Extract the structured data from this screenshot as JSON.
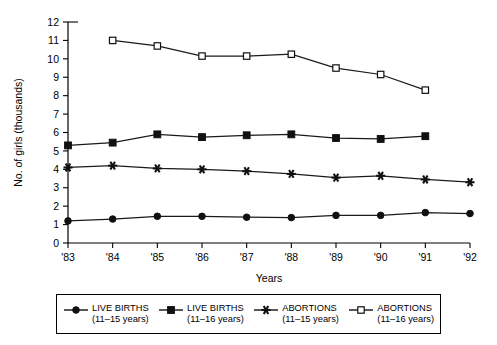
{
  "chart_data": {
    "type": "line",
    "title": "",
    "xlabel": "Years",
    "ylabel": "No. of girls (thousands)",
    "categories": [
      "'83",
      "'84",
      "'85",
      "'86",
      "'87",
      "'88",
      "'89",
      "'90",
      "'91",
      "'92"
    ],
    "ylim": [
      0,
      12
    ],
    "ytick_labels": [
      "0",
      "1",
      "2",
      "3",
      "4",
      "5",
      "6",
      "7",
      "8",
      "9",
      "10",
      "11",
      "12"
    ],
    "yticks": [
      0,
      1,
      2,
      3,
      4,
      5,
      6,
      7,
      8,
      9,
      10,
      11,
      12
    ],
    "grid": false,
    "legend_position": "bottom",
    "series": [
      {
        "name": "LIVE BIRTHS",
        "sublabel": "(11-15 years)",
        "marker": "filled-circle",
        "x": [
          "'83",
          "'84",
          "'85",
          "'86",
          "'87",
          "'88",
          "'89",
          "'90",
          "'91",
          "'92"
        ],
        "values": [
          1.2,
          1.3,
          1.45,
          1.45,
          1.4,
          1.38,
          1.5,
          1.5,
          1.65,
          1.6
        ]
      },
      {
        "name": "LIVE BIRTHS",
        "sublabel": "(11-16 years)",
        "marker": "filled-square",
        "x": [
          "'83",
          "'84",
          "'85",
          "'86",
          "'87",
          "'88",
          "'89",
          "'90",
          "'91"
        ],
        "values": [
          5.3,
          5.45,
          5.9,
          5.75,
          5.85,
          5.9,
          5.7,
          5.65,
          5.8
        ]
      },
      {
        "name": "ABORTIONS",
        "sublabel": "(11-15 years)",
        "marker": "asterisk",
        "x": [
          "'83",
          "'84",
          "'85",
          "'86",
          "'87",
          "'88",
          "'89",
          "'90",
          "'91",
          "'92"
        ],
        "values": [
          4.1,
          4.2,
          4.05,
          4.0,
          3.9,
          3.75,
          3.55,
          3.65,
          3.45,
          3.3
        ]
      },
      {
        "name": "ABORTIONS",
        "sublabel": "(11-16 years)",
        "marker": "open-square",
        "x": [
          "'84",
          "'85",
          "'86",
          "'87",
          "'88",
          "'89",
          "'90",
          "'91"
        ],
        "values": [
          11.0,
          10.7,
          10.15,
          10.15,
          10.25,
          9.5,
          9.15,
          8.3
        ]
      }
    ]
  },
  "legend": {
    "items": [
      {
        "label": "LIVE BIRTHS",
        "sublabel": "(11–15 years)",
        "marker": "filled-circle"
      },
      {
        "label": "LIVE BIRTHS",
        "sublabel": "(11–16 years)",
        "marker": "filled-square"
      },
      {
        "label": "ABORTIONS",
        "sublabel": "(11–15 years)",
        "marker": "asterisk"
      },
      {
        "label": "ABORTIONS",
        "sublabel": "(11–16 years)",
        "marker": "open-square"
      }
    ]
  }
}
